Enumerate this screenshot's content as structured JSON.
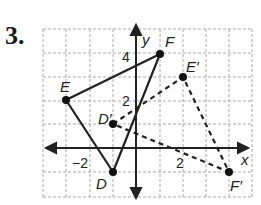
{
  "problem_number": "3.",
  "axes": {
    "x_label": "x",
    "y_label": "y",
    "tick_labels": [
      {
        "text": "4",
        "axis": "y",
        "value": 4
      },
      {
        "text": "2",
        "axis": "y",
        "value": 2
      },
      {
        "text": "−2",
        "axis": "x",
        "value": -2
      },
      {
        "text": "2",
        "axis": "x",
        "value": 2
      }
    ]
  },
  "grid": {
    "x_range": [
      -4,
      5
    ],
    "y_range": [
      -2,
      5
    ]
  },
  "triangle_original": {
    "style": "solid",
    "points": [
      {
        "label": "D",
        "x": -1,
        "y": -1
      },
      {
        "label": "E",
        "x": -3,
        "y": 2
      },
      {
        "label": "F",
        "x": 1,
        "y": 4
      }
    ]
  },
  "triangle_image": {
    "style": "dashed",
    "points": [
      {
        "label": "D′",
        "x": -1,
        "y": 1
      },
      {
        "label": "E′",
        "x": 2,
        "y": 3
      },
      {
        "label": "F′",
        "x": 4,
        "y": -1
      }
    ]
  },
  "labels": {
    "D": "D",
    "E": "E",
    "F": "F",
    "Dp": "D′",
    "Ep": "E′",
    "Fp": "F′",
    "x": "x",
    "y": "y",
    "t4": "4",
    "t2y": "2",
    "tm2": "−2",
    "t2x": "2"
  }
}
